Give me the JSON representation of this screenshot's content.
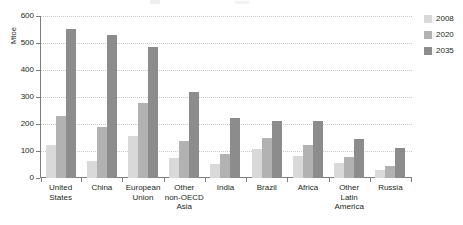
{
  "chart_data": {
    "type": "bar",
    "title": "",
    "subtitle": "",
    "xlabel": "",
    "ylabel": "Mtoe",
    "ylim": [
      0,
      600
    ],
    "yticks": [
      0,
      100,
      200,
      300,
      400,
      500,
      600
    ],
    "ytick_labels": [
      "0",
      "100",
      "200",
      "300",
      "400",
      "500",
      "600"
    ],
    "grid": true,
    "legend_position": "right",
    "categories": [
      "United\nStates",
      "China",
      "European\nUnion",
      "Other\nnon-OECD\nAsia",
      "India",
      "Brazil",
      "Africa",
      "Other\nLatin\nAmerica",
      "Russia"
    ],
    "series": [
      {
        "name": "2008",
        "color": "#d9d9d9",
        "values": [
          122,
          62,
          155,
          75,
          52,
          107,
          83,
          54,
          31
        ]
      },
      {
        "name": "2020",
        "color": "#b2b2b2",
        "values": [
          230,
          188,
          276,
          138,
          89,
          147,
          124,
          76,
          43
        ]
      },
      {
        "name": "2035",
        "color": "#8c8c8c",
        "values": [
          553,
          528,
          484,
          318,
          221,
          211,
          210,
          145,
          112
        ]
      }
    ]
  },
  "axis": {
    "y_title": "Mtoe"
  },
  "legend": {
    "items": [
      {
        "label": "2008",
        "color": "#d9d9d9"
      },
      {
        "label": "2020",
        "color": "#b2b2b2"
      },
      {
        "label": "2035",
        "color": "#8c8c8c"
      }
    ]
  }
}
